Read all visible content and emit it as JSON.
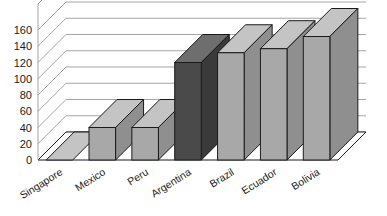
{
  "chart_data": {
    "type": "bar",
    "title": "",
    "subtitle": "",
    "xlabel": "",
    "ylabel": "",
    "categories": [
      "Singapore",
      "Mexico",
      "Peru",
      "Argentina",
      "Brazil",
      "Ecuador",
      "Bolivia"
    ],
    "values": [
      0,
      40,
      40,
      120,
      132,
      137,
      152
    ],
    "ylim": [
      0,
      160
    ],
    "ytick_labels": [
      "0",
      "20",
      "40",
      "60",
      "80",
      "100",
      "120",
      "140",
      "160"
    ],
    "ytick_values": [
      0,
      20,
      40,
      60,
      80,
      100,
      120,
      140,
      160
    ],
    "grid": true,
    "legend": "none",
    "style": "3d-column",
    "highlight_category": "Argentina",
    "colors": {
      "bar_face": "#a8a8a8",
      "bar_top": "#c4c4c4",
      "bar_side": "#8f8f8f",
      "bar_highlight_face": "#4a4a4a",
      "bar_highlight_top": "#6e6e6e",
      "bar_highlight_side": "#3a3a3a",
      "outline": "#1a1a1a",
      "grid": "#9a9a9a",
      "floor": "#ffffff",
      "background": "#ffffff",
      "text": "#1a1a1a"
    }
  }
}
